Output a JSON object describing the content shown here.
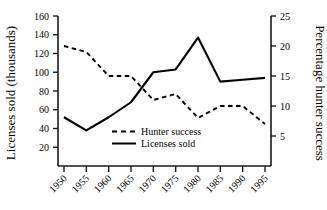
{
  "chart_data": {
    "type": "line",
    "title": "",
    "xlabel": "",
    "ylabel": "Licenses sold (thousands)",
    "y2label": "Percentage hunter success",
    "categories": [
      "1950",
      "1955",
      "1960",
      "1965",
      "1970",
      "1975",
      "1980",
      "1985",
      "1990",
      "1995"
    ],
    "x": [
      1950,
      1955,
      1960,
      1965,
      1970,
      1975,
      1980,
      1985,
      1990,
      1995
    ],
    "ylim": [
      0,
      160
    ],
    "y2lim": [
      0,
      25
    ],
    "yticks": [
      20,
      40,
      60,
      80,
      100,
      120,
      140,
      160
    ],
    "y2ticks": [
      5,
      10,
      15,
      20,
      25
    ],
    "grid": false,
    "legend_position": "inside-lower-center",
    "series": [
      {
        "name": "Hunter success",
        "axis": "right",
        "style": "dashed",
        "color": "#000000",
        "values": [
          20,
          19,
          15,
          15,
          11,
          12,
          8,
          10,
          10,
          7
        ]
      },
      {
        "name": "Licenses sold",
        "axis": "left",
        "style": "solid",
        "color": "#000000",
        "values": [
          52,
          38,
          52,
          68,
          100,
          103,
          137,
          90,
          92,
          94
        ]
      }
    ]
  },
  "axes": {
    "left": {
      "title": "Licenses sold (thousands)",
      "ticks": [
        "20",
        "40",
        "60",
        "80",
        "100",
        "120",
        "140",
        "160"
      ]
    },
    "right": {
      "title": "Percentage hunter success",
      "ticks": [
        "5",
        "10",
        "15",
        "20",
        "25"
      ]
    },
    "bottom": {
      "ticks": [
        "1950",
        "1955",
        "1960",
        "1965",
        "1970",
        "1975",
        "1980",
        "1985",
        "1990",
        "1995"
      ]
    }
  },
  "legend": {
    "items": [
      {
        "label": "Hunter success",
        "style": "dashed"
      },
      {
        "label": "Licenses sold",
        "style": "solid"
      }
    ]
  }
}
